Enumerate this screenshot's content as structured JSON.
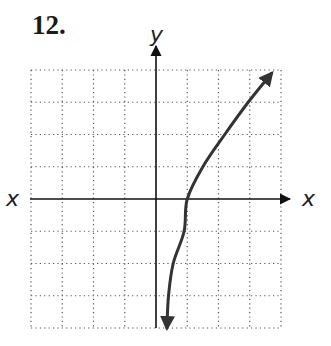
{
  "problem": {
    "number": "12."
  },
  "chart_data": {
    "type": "line",
    "title": "",
    "xlabel": "x",
    "ylabel": "y",
    "xlim": [
      -4,
      4
    ],
    "ylim": [
      -4,
      4
    ],
    "grid": true,
    "grid_style": "dotted",
    "grid_step": 1,
    "axis_labels": {
      "x_left": "x",
      "x_right": "x",
      "y_top": "y"
    },
    "series": [
      {
        "name": "curve",
        "color": "#333333",
        "arrows": "both-ends",
        "points": [
          [
            0.35,
            -4.0
          ],
          [
            0.4,
            -3.0
          ],
          [
            0.55,
            -2.0
          ],
          [
            0.9,
            -1.0
          ],
          [
            1.0,
            0.0
          ],
          [
            1.5,
            1.0
          ],
          [
            2.2,
            2.0
          ],
          [
            2.95,
            3.0
          ],
          [
            3.7,
            3.9
          ]
        ]
      }
    ]
  }
}
